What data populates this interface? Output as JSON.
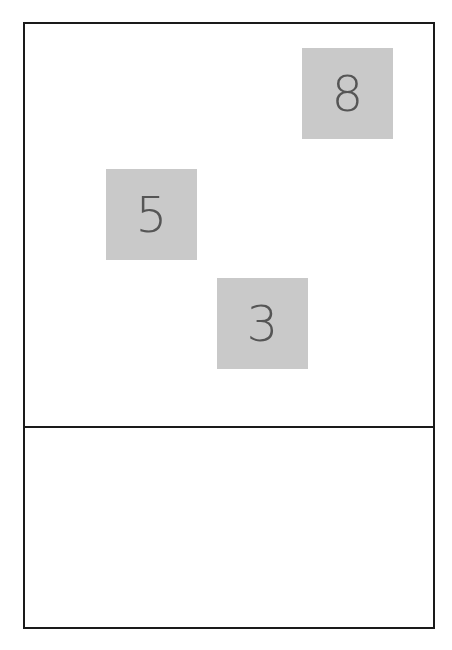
{
  "board": {
    "tiles": [
      {
        "label": "8",
        "x": 277,
        "y": 24
      },
      {
        "label": "5",
        "x": 81,
        "y": 145
      },
      {
        "label": "3",
        "x": 192,
        "y": 254
      }
    ],
    "colors": {
      "tile_bg": "#c9c9c9",
      "tile_text": "#555555",
      "border": "#1a1a1a"
    }
  },
  "tray": {
    "tiles": []
  }
}
